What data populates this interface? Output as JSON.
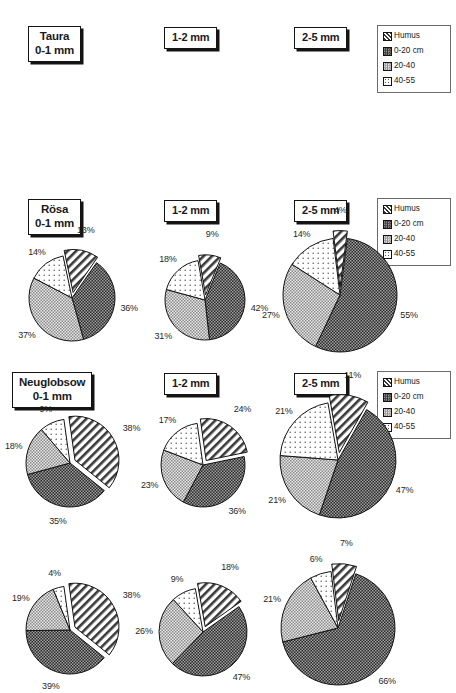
{
  "figure": {
    "type": "pie-chart-matrix",
    "background": "#ffffff"
  },
  "legend": {
    "items": [
      {
        "label": "Humus",
        "pattern": "diagonal-hatch",
        "color": "#8c8c8c"
      },
      {
        "label": "0-20 cm",
        "pattern": "dense-dark-checker",
        "color": "#4a4a4a"
      },
      {
        "label": "20-40",
        "pattern": "light-checker",
        "color": "#c2c2c2"
      },
      {
        "label": "40-55",
        "pattern": "white-sparse-dots",
        "color": "#f2f2f2"
      }
    ]
  },
  "headers": {
    "sites": [
      "Taura",
      "Rösa",
      "Neuglobsow"
    ],
    "size_first": "0-1 mm",
    "size_second": "1-2 mm",
    "size_third": "2-5 mm"
  },
  "chart_data": [
    {
      "type": "pie",
      "title": "Taura 0-1 mm",
      "site": "Taura",
      "size_class": "0-1 mm",
      "row": 1,
      "col": 1,
      "categories": [
        "Humus",
        "0-20 cm",
        "20-40",
        "40-55"
      ],
      "values": [
        13,
        36,
        37,
        14
      ],
      "labels": [
        "13%",
        "36%",
        "37%",
        "14%"
      ],
      "exploded": [
        true,
        false,
        false,
        false
      ]
    },
    {
      "type": "pie",
      "title": "Taura 1-2 mm",
      "site": "Taura",
      "size_class": "1-2 mm",
      "row": 1,
      "col": 2,
      "categories": [
        "Humus",
        "0-20 cm",
        "20-40",
        "40-55"
      ],
      "values": [
        9,
        42,
        31,
        18
      ],
      "labels": [
        "9%",
        "42%",
        "31%",
        "18%"
      ],
      "exploded": [
        true,
        false,
        false,
        false
      ]
    },
    {
      "type": "pie",
      "title": "Taura 2-5 mm",
      "site": "Taura",
      "size_class": "2-5 mm",
      "row": 1,
      "col": 3,
      "categories": [
        "Humus",
        "0-20 cm",
        "20-40",
        "40-55"
      ],
      "values": [
        4,
        55,
        27,
        14
      ],
      "labels": [
        "4%",
        "55%",
        "27%",
        "14%"
      ],
      "exploded": [
        true,
        false,
        false,
        false
      ]
    },
    {
      "type": "pie",
      "title": "Rösa 0-1 mm",
      "site": "Rösa",
      "size_class": "0-1 mm",
      "row": 2,
      "col": 1,
      "categories": [
        "Humus",
        "0-20 cm",
        "20-40",
        "40-55"
      ],
      "values": [
        38,
        35,
        18,
        9
      ],
      "labels": [
        "38%",
        "35%",
        "18%",
        "9%"
      ],
      "exploded": [
        true,
        false,
        false,
        false
      ]
    },
    {
      "type": "pie",
      "title": "Rösa 1-2 mm",
      "site": "Rösa",
      "size_class": "1-2 mm",
      "row": 2,
      "col": 2,
      "categories": [
        "Humus",
        "0-20 cm",
        "20-40",
        "40-55"
      ],
      "values": [
        24,
        36,
        23,
        17
      ],
      "labels": [
        "24%",
        "36%",
        "23%",
        "17%"
      ],
      "exploded": [
        true,
        false,
        false,
        false
      ]
    },
    {
      "type": "pie",
      "title": "Rösa 2-5 mm",
      "site": "Rösa",
      "size_class": "2-5 mm",
      "row": 2,
      "col": 3,
      "categories": [
        "Humus",
        "0-20 cm",
        "20-40",
        "40-55"
      ],
      "values": [
        11,
        47,
        21,
        21
      ],
      "labels": [
        "11%",
        "47%",
        "21%",
        "21%"
      ],
      "exploded": [
        true,
        false,
        false,
        false
      ]
    },
    {
      "type": "pie",
      "title": "Neuglobsow 0-1 mm",
      "site": "Neuglobsow",
      "size_class": "0-1 mm",
      "row": 3,
      "col": 1,
      "categories": [
        "Humus",
        "0-20 cm",
        "20-40",
        "40-55"
      ],
      "values": [
        38,
        39,
        19,
        4
      ],
      "labels": [
        "38%",
        "39%",
        "19%",
        "4%"
      ],
      "exploded": [
        true,
        false,
        false,
        false
      ]
    },
    {
      "type": "pie",
      "title": "Neuglobsow 1-2 mm",
      "site": "Neuglobsow",
      "size_class": "1-2 mm",
      "row": 3,
      "col": 2,
      "categories": [
        "Humus",
        "0-20 cm",
        "20-40",
        "40-55"
      ],
      "values": [
        18,
        47,
        26,
        9
      ],
      "labels": [
        "18%",
        "47%",
        "26%",
        "9%"
      ],
      "exploded": [
        true,
        false,
        false,
        false
      ]
    },
    {
      "type": "pie",
      "title": "Neuglobsow 2-5 mm",
      "site": "Neuglobsow",
      "size_class": "2-5 mm",
      "row": 3,
      "col": 3,
      "categories": [
        "Humus",
        "0-20 cm",
        "20-40",
        "40-55"
      ],
      "values": [
        7,
        66,
        21,
        6
      ],
      "labels": [
        "7%",
        "66%",
        "21%",
        "6%"
      ],
      "exploded": [
        true,
        false,
        false,
        false
      ]
    }
  ],
  "layout": {
    "pies": [
      {
        "cx": 72,
        "cy": 298,
        "r": 43,
        "start": -12
      },
      {
        "cx": 205,
        "cy": 300,
        "r": 40,
        "start": -10
      },
      {
        "cx": 340,
        "cy": 295,
        "r": 57,
        "start": -7
      },
      {
        "cx": 70,
        "cy": 463,
        "r": 44,
        "start": -8
      },
      {
        "cx": 203,
        "cy": 465,
        "r": 42,
        "start": -8
      },
      {
        "cx": 338,
        "cy": 460,
        "r": 58,
        "start": -10
      },
      {
        "cx": 70,
        "cy": 630,
        "r": 44,
        "start": -8
      },
      {
        "cx": 203,
        "cy": 632,
        "r": 44,
        "start": -10
      },
      {
        "cx": 338,
        "cy": 628,
        "r": 57,
        "start": -7
      }
    ]
  }
}
